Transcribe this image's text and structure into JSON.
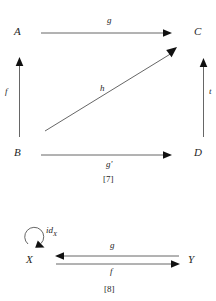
{
  "page": {
    "background": "#ffffff",
    "line_color": "#555555",
    "arrowhead_color": "#111111",
    "text_color": "#262626"
  },
  "diagram_7": {
    "caption": "[7]",
    "objects": {
      "top_left": "A",
      "top_right": "C",
      "bottom_left": "B",
      "bottom_right": "D"
    },
    "morphisms": {
      "top": "g",
      "left": "f",
      "right": "t",
      "diagonal": "h",
      "bottom": "g'"
    }
  },
  "diagram_8": {
    "caption": "[8]",
    "objects": {
      "left": "X",
      "right": "Y"
    },
    "morphisms": {
      "loop_prefix": "id",
      "loop_subscript": "X",
      "upper": "g",
      "lower": "f"
    }
  }
}
